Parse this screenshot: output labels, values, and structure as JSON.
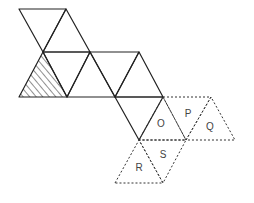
{
  "diagram": {
    "type": "net-of-triangles",
    "colors": {
      "stroke": "#222222",
      "dashed_stroke": "#333333",
      "label": "#444444",
      "background": "#ffffff"
    },
    "solid_triangles": [
      {
        "id": "t1",
        "points": "19,9 66,9 43,52"
      },
      {
        "id": "t2",
        "points": "43,52 66,9 90,52"
      },
      {
        "id": "t3",
        "points": "43,52 90,52 67,97"
      },
      {
        "id": "t4",
        "points": "67,97 90,52 115,97"
      },
      {
        "id": "t5",
        "points": "90,52 139,52 115,97"
      },
      {
        "id": "t6",
        "points": "115,97 139,52 163,97"
      },
      {
        "id": "t7",
        "points": "115,97 163,97 139,140"
      }
    ],
    "shaded_triangle": {
      "id": "shaded",
      "points": "19,97 43,52 67,97",
      "pattern": "diagonal-hatch"
    },
    "dashed_triangles": [
      {
        "label": "O",
        "points": "139,140 163,97 186,140",
        "label_x": 161,
        "label_y": 124
      },
      {
        "label": "P",
        "points": "163,97 211,97 186,140",
        "label_x": 188,
        "label_y": 114
      },
      {
        "label": "Q",
        "points": "186,140 211,97 235,140",
        "label_x": 210,
        "label_y": 127
      },
      {
        "label": "R",
        "points": "115,183 139,140 163,183",
        "label_x": 139,
        "label_y": 168
      },
      {
        "label": "S",
        "points": "139,140 186,140 163,183",
        "label_x": 163,
        "label_y": 155
      }
    ],
    "labels": [
      "O",
      "P",
      "Q",
      "R",
      "S"
    ]
  }
}
